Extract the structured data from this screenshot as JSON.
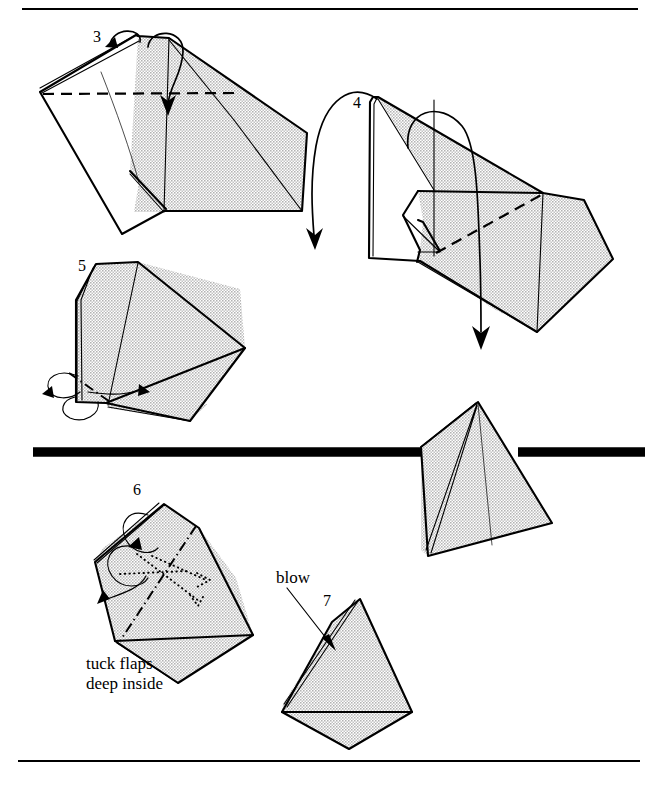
{
  "page": {
    "width": 650,
    "height": 786,
    "background_color": "#ffffff",
    "ink_color": "#000000",
    "paper_shade_color": "#d9d9d9",
    "paper_lit_color": "#ffffff"
  },
  "rules": {
    "top_rule": {
      "name": "top-divider",
      "x1": 22,
      "y1": 9,
      "x2": 638,
      "y2": 9,
      "weight": "thin"
    },
    "mid_rule": {
      "name": "mid-divider",
      "x1": 33,
      "y1": 452,
      "x2": 645,
      "y2": 452,
      "weight": "thick"
    },
    "bottom_rule": {
      "name": "bottom-divider",
      "x1": 18,
      "y1": 761,
      "x2": 640,
      "y2": 761,
      "weight": "thin"
    }
  },
  "steps": [
    {
      "id": "step-3",
      "number": "3",
      "label_x": 93,
      "label_y": 42,
      "description": "Fold the shaded top flap down along the dashed valley line; a loop arrow at the top edge shows the flap turning over.",
      "fold_marks": [
        "valley-fold-dashed-horizontal"
      ],
      "arrows": [
        "loop-arrow-left",
        "loop-arrow-over-top-edge"
      ]
    },
    {
      "id": "step-4",
      "number": "4",
      "label_x": 353,
      "label_y": 108,
      "description": "Repeat behind; large sweeping arrows swing the model around while a dashed valley line marks the next fold.",
      "fold_marks": [
        "valley-fold-dashed-diagonal"
      ],
      "arrows": [
        "big-arc-arrow-left-down",
        "big-arc-arrow-center-down"
      ]
    },
    {
      "id": "step-5",
      "number": "5",
      "label_x": 78,
      "label_y": 271,
      "description": "Inside-reverse-fold the small corner at the lower left; a dash-dot mountain line and twin loop arrows mark it.",
      "fold_marks": [
        "mountain-fold-dash-dot"
      ],
      "arrows": [
        "loop-arrow-upper-left",
        "loop-arrow-lower-left"
      ]
    },
    {
      "id": "step-6",
      "number": "6",
      "label_x": 133,
      "label_y": 495,
      "caption": "tuck flaps\ndeep inside",
      "caption_lines": [
        "tuck flaps",
        "deep inside"
      ],
      "caption_x": 86,
      "caption_y": 669,
      "description": "Tuck the two small flaps deep inside the pocket; dotted lines show the hidden edges and a dash-dot line the crease.",
      "fold_marks": [
        "mountain-fold-dash-dot",
        "hidden-edges-dotted"
      ],
      "arrows": [
        "loop-arrow-upper-left",
        "loop-arrow-lower-left",
        "insert-arrow-right",
        "insert-arrow-down"
      ]
    },
    {
      "id": "step-7",
      "number": "7",
      "label_x": 323,
      "label_y": 606,
      "caption": "blow",
      "caption_x": 276,
      "caption_y": 583,
      "description": "Blow sharply into the small hole at the top-left corner to inflate the finished model.",
      "fold_marks": [],
      "arrows": [
        "blow-pointer-line"
      ]
    }
  ],
  "figures": [
    {
      "id": "figure-step-3",
      "name": "origami-model-step-3",
      "bounds": {
        "x": 38,
        "y": 30,
        "width": 275,
        "height": 220
      }
    },
    {
      "id": "figure-step-4",
      "name": "origami-model-step-4",
      "bounds": {
        "x": 360,
        "y": 88,
        "width": 250,
        "height": 250
      }
    },
    {
      "id": "figure-step-5",
      "name": "origami-model-step-5",
      "bounds": {
        "x": 52,
        "y": 262,
        "width": 200,
        "height": 160
      }
    },
    {
      "id": "figure-pyramid",
      "name": "origami-model-inflated-pyramid",
      "bounds": {
        "x": 405,
        "y": 398,
        "width": 150,
        "height": 160
      }
    },
    {
      "id": "figure-step-6",
      "name": "origami-model-step-6",
      "bounds": {
        "x": 88,
        "y": 498,
        "width": 175,
        "height": 160
      }
    },
    {
      "id": "figure-step-7",
      "name": "origami-model-step-7",
      "bounds": {
        "x": 272,
        "y": 595,
        "width": 145,
        "height": 150
      }
    }
  ]
}
